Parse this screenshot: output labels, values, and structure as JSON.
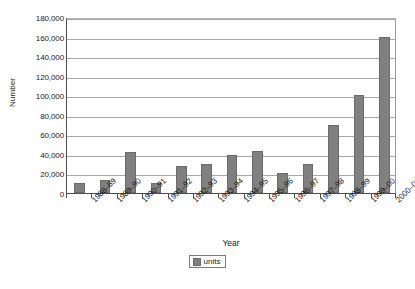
{
  "chart_data": {
    "type": "bar",
    "title": "",
    "xlabel": "Year",
    "ylabel": "Number",
    "ylim": [
      0,
      180000
    ],
    "ytick_step": 20000,
    "grid": true,
    "legend_position": "bottom",
    "series_name": "units",
    "bar_color": "#808080",
    "categories": [
      "1988–89",
      "1989–90",
      "1990–91",
      "1991–92",
      "1992–93",
      "1993–94",
      "1994–95",
      "1995–96",
      "1996–97",
      "1997–98",
      "1998–99",
      "1999–00",
      "2000–01"
    ],
    "values": [
      10000,
      13000,
      42000,
      10000,
      28000,
      30000,
      39000,
      43000,
      20000,
      30000,
      70000,
      100000,
      160000
    ],
    "ytick_labels": [
      "180,000",
      "160,000",
      "140,000",
      "120,000",
      "100,000",
      "80,000",
      "60,000",
      "40,000",
      "20,000",
      "0"
    ],
    "ytick_values": [
      180000,
      160000,
      140000,
      120000,
      100000,
      80000,
      60000,
      40000,
      20000,
      0
    ]
  },
  "legend": {
    "label": "units"
  },
  "caption": {
    "text": ""
  }
}
